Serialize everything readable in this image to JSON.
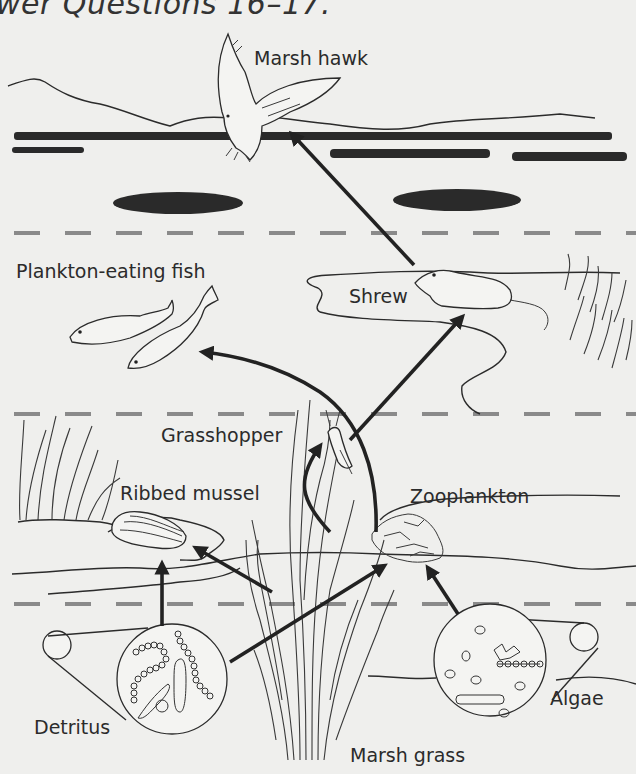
{
  "heading": {
    "text": "wer Questions 16–17."
  },
  "diagram": {
    "labels": {
      "marsh_hawk": "Marsh hawk",
      "plankton_eating_fish": "Plankton-eating fish",
      "shrew": "Shrew",
      "grasshopper": "Grasshopper",
      "ribbed_mussel": "Ribbed mussel",
      "zooplankton": "Zooplankton",
      "detritus": "Detritus",
      "algae": "Algae",
      "marsh_grass": "Marsh grass"
    },
    "arrows": [
      {
        "from": "Shrew",
        "to": "Marsh hawk"
      },
      {
        "from": "Zooplankton",
        "to": "Plankton-eating fish"
      },
      {
        "from": "Grasshopper",
        "to": "Shrew"
      },
      {
        "from": "Marsh grass",
        "to": "Grasshopper"
      },
      {
        "from": "Marsh grass",
        "to": "Ribbed mussel"
      },
      {
        "from": "Detritus",
        "to": "Ribbed mussel"
      },
      {
        "from": "Detritus",
        "to": "Zooplankton"
      },
      {
        "from": "Algae",
        "to": "Zooplankton"
      }
    ],
    "colors": {
      "ink": "#2b2b2b",
      "background": "#efefed",
      "dash": "#8a8a8a"
    }
  }
}
